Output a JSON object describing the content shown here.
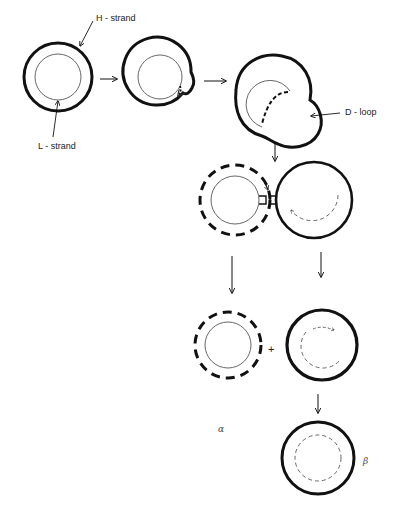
{
  "figure": {
    "labels": {
      "h_strand": "H - strand",
      "l_strand": "L - strand",
      "d_loop": "D - loop",
      "plus": "+",
      "alpha": "α",
      "beta": "β"
    },
    "legend": {
      "thick_solid": "H-strand (parental heavy strand)",
      "thin_solid": "L-strand (parental light strand)",
      "dashed": "newly synthesized strand"
    },
    "stages": [
      {
        "id": "parental",
        "outer": "thick-solid",
        "inner": "thin-solid"
      },
      {
        "id": "initiation",
        "outer": "thick-solid",
        "inner": "thin-solid",
        "note": "small nascent strand with bulge"
      },
      {
        "id": "d-loop",
        "outer": "thick-solid",
        "inner": "thin-solid",
        "note": "expanded displacement loop"
      },
      {
        "id": "segregation",
        "left": {
          "outer": "thick-dashed",
          "inner": "thin-solid"
        },
        "right": {
          "outer": "thick-solid",
          "inner": "thin-dashed"
        }
      },
      {
        "id": "alpha",
        "outer": "thick-dashed",
        "inner": "thin-solid"
      },
      {
        "id": "gapped",
        "outer": "thick-solid",
        "inner": "thin-dashed-partial"
      },
      {
        "id": "beta",
        "outer": "thick-solid",
        "inner": "thin-dashed"
      }
    ],
    "colors": {
      "ink": "#111111",
      "thin_ink": "#555555",
      "background": "#ffffff"
    }
  }
}
